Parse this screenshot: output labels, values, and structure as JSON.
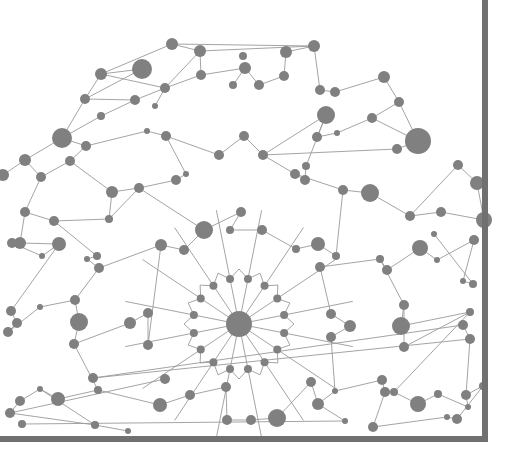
{
  "diagram": {
    "type": "network-graph",
    "colors": {
      "background": "#ffffff",
      "node": "#808080",
      "edge": "#9a9a9a",
      "frame": "#707070"
    },
    "hub": {
      "x": 239,
      "y": 324,
      "r": 13
    },
    "inner_ring": {
      "cx": 239,
      "cy": 324,
      "radius": 46,
      "count": 16,
      "node_r": 4
    },
    "nodes": [
      [
        172,
        44,
        6
      ],
      [
        200,
        51,
        6
      ],
      [
        142,
        69,
        10
      ],
      [
        101,
        74,
        6
      ],
      [
        243,
        56,
        4
      ],
      [
        286,
        52,
        6
      ],
      [
        314,
        46,
        6
      ],
      [
        85,
        99,
        5
      ],
      [
        135,
        100,
        5
      ],
      [
        165,
        88,
        5
      ],
      [
        155,
        106,
        3
      ],
      [
        201,
        75,
        5
      ],
      [
        245,
        68,
        6
      ],
      [
        233,
        85,
        4
      ],
      [
        259,
        85,
        5
      ],
      [
        284,
        76,
        5
      ],
      [
        320,
        90,
        5
      ],
      [
        335,
        92,
        5
      ],
      [
        384,
        77,
        6
      ],
      [
        399,
        102,
        5
      ],
      [
        62,
        138,
        10
      ],
      [
        86,
        146,
        5
      ],
      [
        101,
        116,
        4
      ],
      [
        147,
        131,
        3
      ],
      [
        166,
        136,
        5
      ],
      [
        219,
        155,
        5
      ],
      [
        244,
        136,
        5
      ],
      [
        263,
        155,
        5
      ],
      [
        326,
        115,
        9
      ],
      [
        317,
        137,
        5
      ],
      [
        337,
        133,
        3
      ],
      [
        372,
        118,
        5
      ],
      [
        418,
        141,
        13
      ],
      [
        397,
        149,
        5
      ],
      [
        41,
        177,
        5
      ],
      [
        25,
        160,
        6
      ],
      [
        3,
        175,
        6
      ],
      [
        70,
        161,
        5
      ],
      [
        112,
        192,
        6
      ],
      [
        139,
        188,
        5
      ],
      [
        176,
        180,
        5
      ],
      [
        186,
        174,
        3
      ],
      [
        109,
        219,
        4
      ],
      [
        54,
        221,
        5
      ],
      [
        295,
        174,
        5
      ],
      [
        305,
        180,
        5
      ],
      [
        306,
        166,
        4
      ],
      [
        343,
        190,
        5
      ],
      [
        370,
        193,
        9
      ],
      [
        410,
        216,
        5
      ],
      [
        458,
        165,
        5
      ],
      [
        441,
        212,
        5
      ],
      [
        477,
        183,
        7
      ],
      [
        484,
        220,
        8
      ],
      [
        25,
        212,
        5
      ],
      [
        20,
        243,
        6
      ],
      [
        59,
        244,
        7
      ],
      [
        42,
        256,
        3
      ],
      [
        12,
        243,
        5
      ],
      [
        204,
        230,
        9
      ],
      [
        241,
        212,
        5
      ],
      [
        230,
        230,
        4
      ],
      [
        262,
        230,
        5
      ],
      [
        296,
        249,
        4
      ],
      [
        318,
        244,
        7
      ],
      [
        336,
        256,
        4
      ],
      [
        161,
        245,
        6
      ],
      [
        184,
        250,
        5
      ],
      [
        97,
        256,
        4
      ],
      [
        87,
        259,
        3
      ],
      [
        99,
        268,
        5
      ],
      [
        320,
        267,
        5
      ],
      [
        380,
        259,
        4
      ],
      [
        387,
        270,
        5
      ],
      [
        420,
        248,
        8
      ],
      [
        437,
        260,
        3
      ],
      [
        474,
        240,
        5
      ],
      [
        463,
        281,
        3
      ],
      [
        473,
        284,
        4
      ],
      [
        434,
        234,
        3
      ],
      [
        11,
        311,
        5
      ],
      [
        17,
        323,
        5
      ],
      [
        8,
        332,
        5
      ],
      [
        40,
        307,
        3
      ],
      [
        75,
        300,
        5
      ],
      [
        79,
        322,
        9
      ],
      [
        74,
        344,
        5
      ],
      [
        130,
        323,
        6
      ],
      [
        148,
        313,
        5
      ],
      [
        148,
        345,
        5
      ],
      [
        331,
        314,
        5
      ],
      [
        331,
        337,
        5
      ],
      [
        350,
        326,
        6
      ],
      [
        404,
        305,
        5
      ],
      [
        401,
        326,
        9
      ],
      [
        404,
        347,
        5
      ],
      [
        470,
        312,
        4
      ],
      [
        463,
        325,
        5
      ],
      [
        470,
        339,
        5
      ],
      [
        93,
        378,
        5
      ],
      [
        98,
        390,
        4
      ],
      [
        58,
        399,
        7
      ],
      [
        40,
        389,
        3
      ],
      [
        20,
        401,
        5
      ],
      [
        10,
        413,
        5
      ],
      [
        165,
        379,
        5
      ],
      [
        160,
        405,
        7
      ],
      [
        190,
        395,
        5
      ],
      [
        226,
        387,
        5
      ],
      [
        227,
        420,
        5
      ],
      [
        251,
        420,
        5
      ],
      [
        277,
        418,
        9
      ],
      [
        311,
        382,
        5
      ],
      [
        318,
        404,
        6
      ],
      [
        335,
        391,
        3
      ],
      [
        382,
        380,
        5
      ],
      [
        385,
        392,
        5
      ],
      [
        394,
        392,
        4
      ],
      [
        418,
        404,
        8
      ],
      [
        438,
        394,
        4
      ],
      [
        468,
        407,
        3
      ],
      [
        466,
        395,
        5
      ],
      [
        483,
        386,
        4
      ],
      [
        457,
        419,
        5
      ],
      [
        447,
        417,
        3
      ],
      [
        373,
        427,
        5
      ],
      [
        345,
        421,
        3
      ],
      [
        22,
        424,
        4
      ],
      [
        95,
        425,
        4
      ],
      [
        128,
        431,
        3
      ]
    ],
    "edges": [
      [
        0,
        1
      ],
      [
        0,
        3
      ],
      [
        0,
        6
      ],
      [
        1,
        11
      ],
      [
        1,
        6
      ],
      [
        1,
        9
      ],
      [
        3,
        2
      ],
      [
        3,
        7
      ],
      [
        3,
        9
      ],
      [
        2,
        7
      ],
      [
        9,
        10
      ],
      [
        9,
        11
      ],
      [
        11,
        12
      ],
      [
        12,
        13
      ],
      [
        12,
        14
      ],
      [
        14,
        15
      ],
      [
        15,
        5
      ],
      [
        5,
        6
      ],
      [
        6,
        16
      ],
      [
        16,
        17
      ],
      [
        17,
        18
      ],
      [
        18,
        19
      ],
      [
        19,
        32
      ],
      [
        7,
        8
      ],
      [
        7,
        20
      ],
      [
        8,
        9
      ],
      [
        8,
        22
      ],
      [
        22,
        20
      ],
      [
        20,
        21
      ],
      [
        21,
        23
      ],
      [
        23,
        24
      ],
      [
        24,
        25
      ],
      [
        25,
        26
      ],
      [
        26,
        27
      ],
      [
        27,
        28
      ],
      [
        28,
        29
      ],
      [
        29,
        30
      ],
      [
        30,
        31
      ],
      [
        31,
        19
      ],
      [
        31,
        32
      ],
      [
        32,
        33
      ],
      [
        33,
        27
      ],
      [
        20,
        35
      ],
      [
        35,
        36
      ],
      [
        35,
        34
      ],
      [
        34,
        37
      ],
      [
        37,
        21
      ],
      [
        37,
        38
      ],
      [
        38,
        39
      ],
      [
        39,
        40
      ],
      [
        40,
        41
      ],
      [
        41,
        24
      ],
      [
        38,
        42
      ],
      [
        42,
        43
      ],
      [
        43,
        54
      ],
      [
        54,
        34
      ],
      [
        54,
        55
      ],
      [
        55,
        56
      ],
      [
        56,
        57
      ],
      [
        57,
        58
      ],
      [
        58,
        55
      ],
      [
        42,
        39
      ],
      [
        39,
        59
      ],
      [
        59,
        60
      ],
      [
        60,
        61
      ],
      [
        61,
        62
      ],
      [
        62,
        63
      ],
      [
        63,
        64
      ],
      [
        64,
        65
      ],
      [
        65,
        47
      ],
      [
        47,
        48
      ],
      [
        48,
        49
      ],
      [
        49,
        50
      ],
      [
        50,
        52
      ],
      [
        52,
        53
      ],
      [
        53,
        51
      ],
      [
        51,
        49
      ],
      [
        44,
        45
      ],
      [
        45,
        46
      ],
      [
        46,
        28
      ],
      [
        44,
        47
      ],
      [
        44,
        27
      ],
      [
        43,
        68
      ],
      [
        68,
        69
      ],
      [
        69,
        70
      ],
      [
        70,
        66
      ],
      [
        66,
        67
      ],
      [
        67,
        59
      ],
      [
        56,
        80
      ],
      [
        80,
        81
      ],
      [
        81,
        82
      ],
      [
        82,
        83
      ],
      [
        83,
        84
      ],
      [
        84,
        85
      ],
      [
        85,
        86
      ],
      [
        86,
        87
      ],
      [
        87,
        88
      ],
      [
        88,
        89
      ],
      [
        89,
        66
      ],
      [
        70,
        84
      ],
      [
        71,
        72
      ],
      [
        72,
        73
      ],
      [
        73,
        74
      ],
      [
        74,
        75
      ],
      [
        75,
        76
      ],
      [
        76,
        77
      ],
      [
        77,
        78
      ],
      [
        78,
        79
      ],
      [
        71,
        90
      ],
      [
        90,
        92
      ],
      [
        92,
        91
      ],
      [
        72,
        93
      ],
      [
        93,
        94
      ],
      [
        94,
        96
      ],
      [
        96,
        95
      ],
      [
        95,
        93
      ],
      [
        97,
        98
      ],
      [
        98,
        99
      ],
      [
        99,
        97
      ],
      [
        86,
        100
      ],
      [
        100,
        101
      ],
      [
        101,
        102
      ],
      [
        102,
        103
      ],
      [
        103,
        104
      ],
      [
        104,
        105
      ],
      [
        100,
        106
      ],
      [
        106,
        107
      ],
      [
        107,
        108
      ],
      [
        108,
        109
      ],
      [
        109,
        110
      ],
      [
        110,
        111
      ],
      [
        111,
        112
      ],
      [
        112,
        113
      ],
      [
        113,
        114
      ],
      [
        114,
        115
      ],
      [
        115,
        116
      ],
      [
        116,
        117
      ],
      [
        117,
        118
      ],
      [
        118,
        119
      ],
      [
        119,
        120
      ],
      [
        120,
        121
      ],
      [
        121,
        122
      ],
      [
        122,
        123
      ],
      [
        123,
        124
      ],
      [
        124,
        125
      ],
      [
        125,
        116
      ],
      [
        113,
        126
      ],
      [
        126,
        127
      ],
      [
        104,
        128
      ],
      [
        128,
        129
      ],
      [
        129,
        130
      ],
      [
        98,
        121
      ],
      [
        102,
        128
      ],
      [
        91,
        114
      ],
      [
        96,
        117
      ]
    ]
  }
}
